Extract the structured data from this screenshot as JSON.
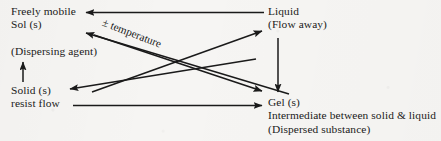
{
  "diagram": {
    "type": "process-transition-diagram",
    "background_color": "#f6f5f3",
    "ink_color": "#1a1a1a",
    "nodes": {
      "sol": {
        "line1": "Freely mobile",
        "line2": "Sol (s)"
      },
      "dispersing_agent": {
        "line1": "(Dispersing agent)"
      },
      "solid": {
        "line1": "Solid (s)",
        "line2": "resist flow"
      },
      "liquid": {
        "line1": "Liquid",
        "line2": "(Flow away)"
      },
      "gel": {
        "line1": "Gel (s)",
        "line2": "Intermediate between solid & liquid",
        "line3": "(Dispersed substance)"
      }
    },
    "edge_labels": {
      "temperature": "± temperature"
    },
    "edges": [
      {
        "name": "liquid-to-sol",
        "from": "liquid",
        "to": "sol",
        "direction": "left",
        "style": "horizontal"
      },
      {
        "name": "sol-to-liquid",
        "from": "sol",
        "to": "liquid",
        "direction": "right",
        "style": "horizontal"
      },
      {
        "name": "gel-to-sol",
        "from": "gel",
        "to": "sol",
        "direction": "up-left",
        "style": "diagonal"
      },
      {
        "name": "sol-to-gel",
        "from": "sol",
        "to": "gel",
        "direction": "down-right",
        "style": "diagonal"
      },
      {
        "name": "solid-to-liquid",
        "from": "solid",
        "to": "liquid",
        "direction": "up-right",
        "style": "diagonal"
      },
      {
        "name": "liquid-to-solid",
        "from": "liquid",
        "to": "solid",
        "direction": "down-left",
        "style": "diagonal"
      },
      {
        "name": "solid-to-agent",
        "from": "solid",
        "to": "dispersing_agent",
        "direction": "up",
        "style": "vertical"
      },
      {
        "name": "liquid-to-gel",
        "from": "liquid",
        "to": "gel",
        "direction": "down",
        "style": "vertical"
      },
      {
        "name": "resistflow-to-gel",
        "from": "solid",
        "to": "gel",
        "direction": "right",
        "style": "horizontal"
      }
    ]
  }
}
